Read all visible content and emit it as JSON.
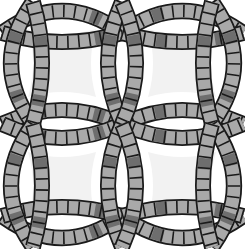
{
  "figure": {
    "width": 245,
    "height": 249,
    "colors": {
      "background": "#ffffff",
      "center_piece": "#f2f2f2",
      "outline": "#1a1a1a",
      "segment_light": "#a9a9a9",
      "segment_dark": "#6e6e6e"
    },
    "band_width": 13,
    "segment_length": 11,
    "melons": [
      {
        "id": "top-left-top",
        "a": [
          2,
          33
        ],
        "b": [
          122,
          33
        ],
        "outer": [
          62,
          -11
        ],
        "inner": [
          62,
          51
        ]
      },
      {
        "id": "top-right-top",
        "a": [
          122,
          33
        ],
        "b": [
          243,
          33
        ],
        "outer": [
          182,
          -11
        ],
        "inner": [
          182,
          51
        ]
      },
      {
        "id": "mid-left",
        "a": [
          2,
          124
        ],
        "b": [
          122,
          124
        ],
        "outer": [
          62,
          96
        ],
        "inner": [
          62,
          152
        ]
      },
      {
        "id": "mid-right",
        "a": [
          122,
          124
        ],
        "b": [
          243,
          124
        ],
        "outer": [
          182,
          96
        ],
        "inner": [
          182,
          152
        ]
      },
      {
        "id": "bottom-left",
        "a": [
          2,
          216
        ],
        "b": [
          122,
          216
        ],
        "outer": [
          62,
          260
        ],
        "inner": [
          62,
          198
        ]
      },
      {
        "id": "bottom-right",
        "a": [
          122,
          216
        ],
        "b": [
          243,
          216
        ],
        "outer": [
          182,
          260
        ],
        "inner": [
          182,
          198
        ]
      },
      {
        "id": "left-top",
        "a": [
          33,
          2
        ],
        "b": [
          33,
          124
        ],
        "outer": [
          -11,
          63
        ],
        "inner": [
          51,
          63
        ]
      },
      {
        "id": "left-bottom",
        "a": [
          33,
          124
        ],
        "b": [
          33,
          247
        ],
        "outer": [
          -11,
          186
        ],
        "inner": [
          51,
          186
        ]
      },
      {
        "id": "center-top",
        "a": [
          122,
          2
        ],
        "b": [
          122,
          124
        ],
        "outer": [
          94,
          63
        ],
        "inner": [
          150,
          63
        ]
      },
      {
        "id": "center-bottom",
        "a": [
          122,
          124
        ],
        "b": [
          122,
          247
        ],
        "outer": [
          94,
          186
        ],
        "inner": [
          150,
          186
        ]
      },
      {
        "id": "right-top",
        "a": [
          212,
          2
        ],
        "b": [
          212,
          124
        ],
        "outer": [
          256,
          63
        ],
        "inner": [
          194,
          63
        ]
      },
      {
        "id": "right-bottom",
        "a": [
          212,
          124
        ],
        "b": [
          212,
          247
        ],
        "outer": [
          256,
          186
        ],
        "inner": [
          194,
          186
        ]
      }
    ],
    "center_pieces": [
      {
        "id": "top-left",
        "cx": 62,
        "cy": 63
      },
      {
        "id": "top-right",
        "cx": 182,
        "cy": 63
      },
      {
        "id": "bottom-left",
        "cx": 62,
        "cy": 186
      },
      {
        "id": "bottom-right",
        "cx": 182,
        "cy": 186
      }
    ]
  }
}
